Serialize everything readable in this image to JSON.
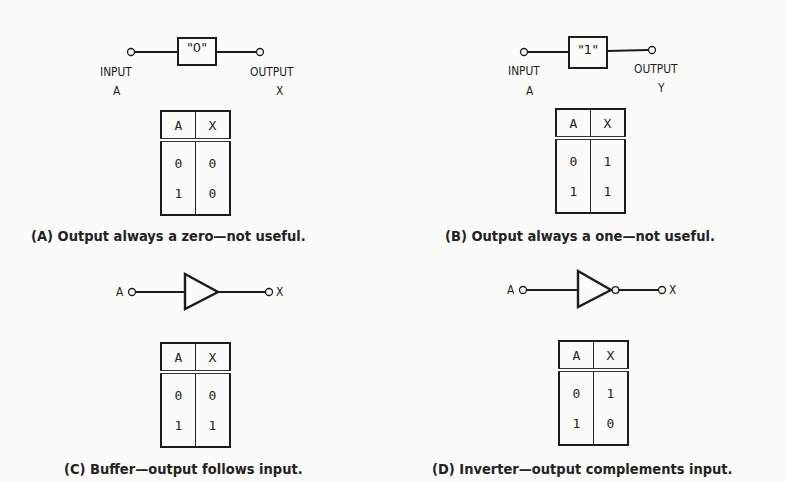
{
  "panels": [
    {
      "id": "A",
      "block_label": "\"0\"",
      "input_label": "INPUT",
      "input_var": "A",
      "output_label": "OUTPUT",
      "output_var": "X",
      "table": {
        "headers": [
          "A",
          "X"
        ],
        "rows": [
          [
            "0",
            "0"
          ],
          [
            "1",
            "0"
          ]
        ]
      },
      "caption": "(A) Output always a zero—not useful."
    },
    {
      "id": "B",
      "block_label": "\"1\"",
      "input_label": "INPUT",
      "input_var": "A",
      "output_label": "OUTPUT",
      "output_var": "Y",
      "table": {
        "headers": [
          "A",
          "X"
        ],
        "rows": [
          [
            "0",
            "1"
          ],
          [
            "1",
            "1"
          ]
        ]
      },
      "caption": "(B) Output always a one—not useful."
    },
    {
      "id": "C",
      "gate": "buffer",
      "input_var": "A",
      "output_var": "X",
      "table": {
        "headers": [
          "A",
          "X"
        ],
        "rows": [
          [
            "0",
            "0"
          ],
          [
            "1",
            "1"
          ]
        ]
      },
      "caption": "(C) Buffer—output follows input."
    },
    {
      "id": "D",
      "gate": "inverter",
      "input_var": "A",
      "output_var": "X",
      "table": {
        "headers": [
          "A",
          "X"
        ],
        "rows": [
          [
            "0",
            "1"
          ],
          [
            "1",
            "0"
          ]
        ]
      },
      "caption": "(D) Inverter—output complements input."
    }
  ]
}
